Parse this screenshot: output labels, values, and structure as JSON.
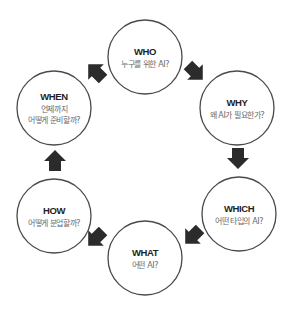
{
  "diagram": {
    "type": "cycle",
    "direction": "clockwise",
    "colors": {
      "circle_stroke": "#4a4a4a",
      "arrow": "#2b2b2b",
      "title": "#1e1e1e",
      "subtitle": "#6a6a6a"
    },
    "nodes": [
      {
        "id": "who",
        "title": "WHO",
        "lines": [
          "누구를 위한 AI?"
        ]
      },
      {
        "id": "why",
        "title": "WHY",
        "lines": [
          "왜 AI가 필요한가?"
        ]
      },
      {
        "id": "which",
        "title": "WHICH",
        "lines": [
          "어떤 타입의 AI?"
        ]
      },
      {
        "id": "what",
        "title": "WHAT",
        "lines": [
          "어떤 AI?"
        ]
      },
      {
        "id": "how",
        "title": "HOW",
        "lines": [
          "어떻게 분업할까?"
        ]
      },
      {
        "id": "when",
        "title": "WHEN",
        "lines": [
          "언제까지",
          "어떻게 준비할까?"
        ]
      }
    ],
    "edges": [
      {
        "from": "who",
        "to": "why"
      },
      {
        "from": "why",
        "to": "which"
      },
      {
        "from": "which",
        "to": "what"
      },
      {
        "from": "what",
        "to": "how"
      },
      {
        "from": "how",
        "to": "when"
      },
      {
        "from": "when",
        "to": "who"
      }
    ]
  }
}
